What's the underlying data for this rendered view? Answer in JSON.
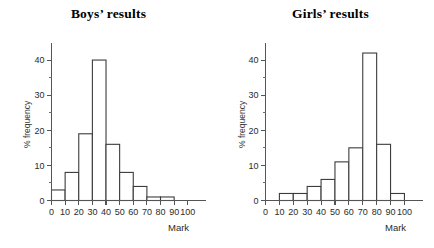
{
  "page": {
    "background_color": "#ffffff",
    "ink_color": "#3c3c3c"
  },
  "charts": [
    {
      "id": "boys",
      "title": "Boys’ results",
      "ylabel": "% frequency",
      "xlabel": "Mark",
      "y_ticks_major": [
        "0",
        "10",
        "20",
        "30",
        "40"
      ],
      "x_ticks": [
        "0",
        "10",
        "20",
        "30",
        "40",
        "50",
        "60",
        "70",
        "80",
        "90",
        "100"
      ]
    },
    {
      "id": "girls",
      "title": "Girls’ results",
      "ylabel": "% frequency",
      "xlabel": "Mark",
      "y_ticks_major": [
        "0",
        "10",
        "20",
        "30",
        "40"
      ],
      "x_ticks": [
        "0",
        "10",
        "20",
        "30",
        "40",
        "50",
        "60",
        "70",
        "80",
        "90",
        "100"
      ]
    }
  ],
  "chart_data": [
    {
      "type": "bar",
      "id": "boys",
      "title": "Boys’ results",
      "xlabel": "Mark",
      "ylabel": "% frequency",
      "categories": [
        "0–10",
        "10–20",
        "20–30",
        "30–40",
        "40–50",
        "50–60",
        "60–70",
        "70–80",
        "80–90",
        "90–100"
      ],
      "bin_edges": [
        0,
        10,
        20,
        30,
        40,
        50,
        60,
        70,
        80,
        90,
        100
      ],
      "values": [
        3,
        8,
        19,
        40,
        16,
        8,
        4,
        1,
        1,
        0
      ],
      "xlim": [
        0,
        113
      ],
      "ylim": [
        0,
        45
      ],
      "y_major_step": 10,
      "y_minor_step": 5,
      "grid": false,
      "legend": "none"
    },
    {
      "type": "bar",
      "id": "girls",
      "title": "Girls’ results",
      "xlabel": "Mark",
      "ylabel": "% frequency",
      "categories": [
        "0–10",
        "10–20",
        "20–30",
        "30–40",
        "40–50",
        "50–60",
        "60–70",
        "70–80",
        "80–90",
        "90–100"
      ],
      "bin_edges": [
        0,
        10,
        20,
        30,
        40,
        50,
        60,
        70,
        80,
        90,
        100
      ],
      "values": [
        0,
        2,
        2,
        4,
        6,
        11,
        15,
        42,
        16,
        2
      ],
      "xlim": [
        0,
        113
      ],
      "ylim": [
        0,
        45
      ],
      "y_major_step": 10,
      "y_minor_step": 5,
      "grid": false,
      "legend": "none"
    }
  ]
}
